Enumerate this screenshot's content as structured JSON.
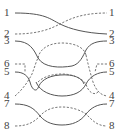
{
  "diagram": {
    "type": "wire-crossing / permutation diagram",
    "left_labels": [
      {
        "text": "1",
        "y": 12
      },
      {
        "text": "2",
        "y": 33
      },
      {
        "text": "3",
        "y": 40
      },
      {
        "text": "6",
        "y": 63
      },
      {
        "text": "5",
        "y": 71
      },
      {
        "text": "4",
        "y": 95
      },
      {
        "text": "7",
        "y": 103
      },
      {
        "text": "8",
        "y": 125
      }
    ],
    "right_labels": [
      {
        "text": "1",
        "y": 12
      },
      {
        "text": "2",
        "y": 33
      },
      {
        "text": "3",
        "y": 40
      },
      {
        "text": "6",
        "y": 63
      },
      {
        "text": "5",
        "y": 71
      },
      {
        "text": "4",
        "y": 95
      },
      {
        "text": "7",
        "y": 103
      },
      {
        "text": "8",
        "y": 125
      }
    ],
    "colors": {
      "line": "#555555",
      "background": "#ffffff"
    }
  }
}
